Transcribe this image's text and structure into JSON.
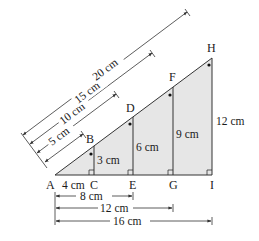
{
  "points": {
    "A": "A",
    "B": "B",
    "C": "C",
    "D": "D",
    "E": "E",
    "F": "F",
    "G": "G",
    "H": "H",
    "I": "I"
  },
  "heights": {
    "BC": "3 cm",
    "DE": "6 cm",
    "FG": "9 cm",
    "HI": "12 cm"
  },
  "base": {
    "AC": "4 cm"
  },
  "hypotenuse_dims": [
    {
      "label": "5 cm",
      "to": "B"
    },
    {
      "label": "10 cm",
      "to": "D"
    },
    {
      "label": "15 cm",
      "to": "F"
    },
    {
      "label": "20 cm",
      "to": "H"
    }
  ],
  "base_dims": [
    {
      "label": "8 cm",
      "to": "E"
    },
    {
      "label": "12 cm",
      "to": "G"
    },
    {
      "label": "16 cm",
      "to": "I"
    }
  ],
  "colors": {
    "fill": "#e6e6e6",
    "stroke": "#333333"
  }
}
